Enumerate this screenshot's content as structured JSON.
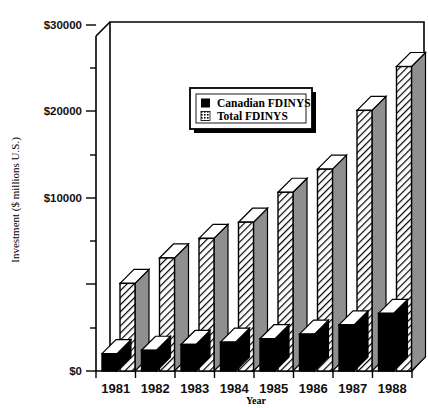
{
  "chart_data": {
    "type": "bar",
    "title": "",
    "xlabel": "Year",
    "ylabel": "Investment ($ millions U.S.)",
    "categories": [
      "1981",
      "1982",
      "1983",
      "1984",
      "1985",
      "1986",
      "1987",
      "1988"
    ],
    "series": [
      {
        "name": "Canadian FDINYS",
        "values": [
          1500,
          1800,
          2300,
          2500,
          2800,
          3200,
          4000,
          5000
        ]
      },
      {
        "name": "Total FDINYS",
        "values": [
          7600,
          9800,
          11500,
          12900,
          15500,
          17500,
          22600,
          26400
        ]
      }
    ],
    "ylim": [
      0,
      30000
    ],
    "ytick_values": [
      0,
      10000,
      20000,
      30000
    ],
    "ytick_labels": [
      "$0",
      "$10000",
      "$20000",
      "$30000"
    ],
    "yminor_values": [
      5000,
      15000,
      25000
    ],
    "grid": false,
    "legend_position": "upper-center",
    "style": "3d-bars",
    "colors": {
      "canadian": "#000000",
      "total_front": "#ffffff",
      "total_hatch": "#000000",
      "total_side": "#8a8a8a",
      "total_top": "#ffffff",
      "axis": "#000000",
      "background": "#ffffff"
    }
  },
  "legend": {
    "entries": [
      {
        "label": "Canadian FDINYS",
        "swatch": "solid-black"
      },
      {
        "label": "Total FDINYS",
        "swatch": "hatched"
      }
    ]
  },
  "axes": {
    "y_title": "Investment ($ millions U.S.)",
    "x_title": "Year"
  }
}
